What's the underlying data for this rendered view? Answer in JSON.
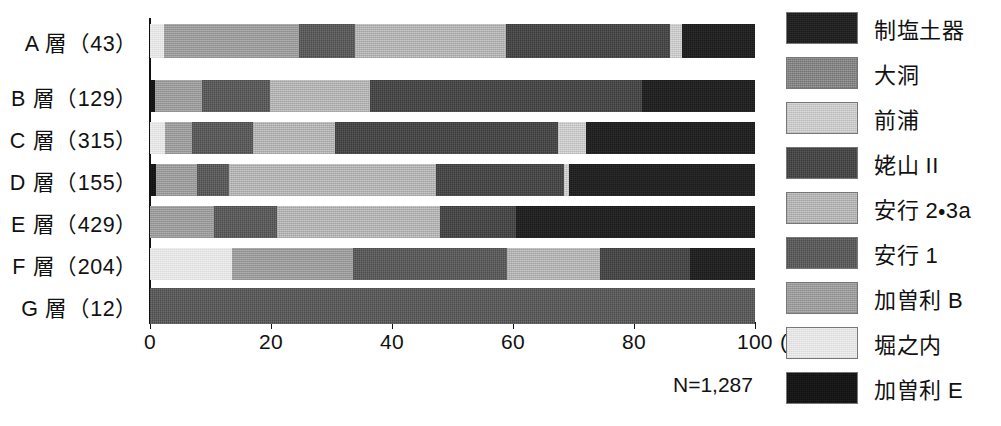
{
  "chart_data": {
    "type": "bar",
    "orientation": "horizontal",
    "stacked": true,
    "normalized_percent": true,
    "title": "",
    "xlabel": "(%)",
    "ylabel": "",
    "xlim": [
      0,
      100
    ],
    "xticks": [
      0,
      20,
      40,
      60,
      80,
      100
    ],
    "xticklabels": [
      "0",
      "20",
      "40",
      "60",
      "80",
      "100"
    ],
    "xunit_label": "(%)",
    "grid": false,
    "legend_position": "right",
    "annotation": "N=1,287",
    "categories": [
      "A 層（43）",
      "B 層（129）",
      "C 層（315）",
      "D 層（155）",
      "E 層（429）",
      "F 層（204）",
      "G 層（12）"
    ],
    "category_counts": [
      43,
      129,
      315,
      155,
      429,
      204,
      12
    ],
    "series": [
      {
        "name": "制塩土器",
        "key": "seien",
        "color": "#232323",
        "values": [
          12.0,
          18.6,
          28.0,
          31.5,
          39.5,
          10.7,
          0.0
        ]
      },
      {
        "name": "大洞",
        "key": "dairyu",
        "color": "#8a8a8a",
        "values": [
          0.0,
          0.0,
          0.0,
          0.0,
          0.0,
          0.0,
          0.0
        ]
      },
      {
        "name": "前浦",
        "key": "maeura",
        "color": "#dcdcdc",
        "values": [
          2.0,
          0.0,
          4.5,
          0.8,
          0.0,
          0.0,
          0.0
        ]
      },
      {
        "name": "姥山 II",
        "key": "ubayama",
        "color": "#4a4a4a",
        "values": [
          27.1,
          45.1,
          37.0,
          21.2,
          12.5,
          15.0,
          0.0
        ]
      },
      {
        "name": "安行 2・3a",
        "key": "angyo23",
        "color": "#c8c8c8",
        "values": [
          25.0,
          16.5,
          13.5,
          34.2,
          27.0,
          15.3,
          0.0
        ]
      },
      {
        "name": "安行 1",
        "key": "angyo1",
        "color": "#5e5e5e",
        "values": [
          9.3,
          11.2,
          10.0,
          5.2,
          10.5,
          25.5,
          100.0
        ]
      },
      {
        "name": "加曽利 B",
        "key": "kasoriB",
        "color": "#a6a6a6",
        "values": [
          22.3,
          7.8,
          4.5,
          6.8,
          10.5,
          20.0,
          0.0
        ]
      },
      {
        "name": "堀之内",
        "key": "horinouchi",
        "color": "#f0f0f0",
        "values": [
          2.3,
          0.0,
          2.5,
          0.3,
          0.0,
          13.5,
          0.0
        ]
      },
      {
        "name": "加曽利 E",
        "key": "kasoriE",
        "color": "#171717",
        "values": [
          0.0,
          0.8,
          0.0,
          1.0,
          0.0,
          0.0,
          0.0
        ]
      }
    ],
    "stack_order_left_to_right": [
      "kasoriE",
      "horinouchi",
      "kasoriB",
      "angyo1",
      "angyo23",
      "ubayama",
      "maeura",
      "dairyu",
      "seien"
    ],
    "rows": [
      {
        "label": "A 層（43）",
        "n": 43,
        "segments": [
          {
            "key": "horinouchi",
            "name": "堀之内",
            "value": 2.3
          },
          {
            "key": "kasoriB",
            "name": "加曽利 B",
            "value": 22.3
          },
          {
            "key": "angyo1",
            "name": "安行 1",
            "value": 9.3
          },
          {
            "key": "angyo23",
            "name": "安行 2・3a",
            "value": 25.0
          },
          {
            "key": "ubayama",
            "name": "姥山 II",
            "value": 27.1
          },
          {
            "key": "maeura",
            "name": "前浦",
            "value": 2.0
          },
          {
            "key": "seien",
            "name": "制塩土器",
            "value": 12.0
          }
        ]
      },
      {
        "label": "B 層（129）",
        "n": 129,
        "segments": [
          {
            "key": "kasoriE",
            "name": "加曽利 E",
            "value": 0.8
          },
          {
            "key": "kasoriB",
            "name": "加曽利 B",
            "value": 7.8
          },
          {
            "key": "angyo1",
            "name": "安行 1",
            "value": 11.2
          },
          {
            "key": "angyo23",
            "name": "安行 2・3a",
            "value": 16.5
          },
          {
            "key": "ubayama",
            "name": "姥山 II",
            "value": 45.1
          },
          {
            "key": "seien",
            "name": "制塩土器",
            "value": 18.6
          }
        ]
      },
      {
        "label": "C 層（315）",
        "n": 315,
        "segments": [
          {
            "key": "horinouchi",
            "name": "堀之内",
            "value": 2.5
          },
          {
            "key": "kasoriB",
            "name": "加曽利 B",
            "value": 4.5
          },
          {
            "key": "angyo1",
            "name": "安行 1",
            "value": 10.0
          },
          {
            "key": "angyo23",
            "name": "安行 2・3a",
            "value": 13.5
          },
          {
            "key": "ubayama",
            "name": "姥山 II",
            "value": 37.0
          },
          {
            "key": "maeura",
            "name": "前浦",
            "value": 4.5
          },
          {
            "key": "seien",
            "name": "制塩土器",
            "value": 28.0
          }
        ]
      },
      {
        "label": "D 層（155）",
        "n": 155,
        "segments": [
          {
            "key": "kasoriE",
            "name": "加曽利 E",
            "value": 1.0
          },
          {
            "key": "kasoriB",
            "name": "加曽利 B",
            "value": 6.8
          },
          {
            "key": "angyo1",
            "name": "安行 1",
            "value": 5.2
          },
          {
            "key": "angyo23",
            "name": "安行 2・3a",
            "value": 34.2
          },
          {
            "key": "ubayama",
            "name": "姥山 II",
            "value": 21.2
          },
          {
            "key": "maeura",
            "name": "前浦",
            "value": 0.8
          },
          {
            "key": "seien",
            "name": "制塩土器",
            "value": 30.8
          }
        ]
      },
      {
        "label": "E 層（429）",
        "n": 429,
        "segments": [
          {
            "key": "kasoriB",
            "name": "加曽利 B",
            "value": 10.5
          },
          {
            "key": "angyo1",
            "name": "安行 1",
            "value": 10.5
          },
          {
            "key": "angyo23",
            "name": "安行 2・3a",
            "value": 27.0
          },
          {
            "key": "ubayama",
            "name": "姥山 II",
            "value": 12.5
          },
          {
            "key": "seien",
            "name": "制塩土器",
            "value": 39.5
          }
        ]
      },
      {
        "label": "F 層（204）",
        "n": 204,
        "segments": [
          {
            "key": "horinouchi",
            "name": "堀之内",
            "value": 13.5
          },
          {
            "key": "kasoriB",
            "name": "加曽利 B",
            "value": 20.0
          },
          {
            "key": "angyo1",
            "name": "安行 1",
            "value": 25.5
          },
          {
            "key": "angyo23",
            "name": "安行 2・3a",
            "value": 15.3
          },
          {
            "key": "ubayama",
            "name": "姥山 II",
            "value": 15.0
          },
          {
            "key": "seien",
            "name": "制塩土器",
            "value": 10.7
          }
        ]
      },
      {
        "label": "G 層（12）",
        "n": 12,
        "segments": [
          {
            "key": "angyo1",
            "name": "安行 1",
            "value": 100.0
          }
        ]
      }
    ]
  },
  "axis": {
    "ticklabels": [
      "0",
      "20",
      "40",
      "60",
      "80",
      "100"
    ],
    "unit": "(%)"
  },
  "ylabels": [
    "A 層（43）",
    "B 層（129）",
    "C 層（315）",
    "D 層（155）",
    "E 層（429）",
    "F 層（204）",
    "G 層（12）"
  ],
  "annotation": {
    "n_total": "N=1,287"
  },
  "legend": {
    "items": [
      {
        "label": "制塩土器",
        "key": "seien",
        "color": "#232323"
      },
      {
        "label": "大洞",
        "key": "dairyu",
        "color": "#8a8a8a"
      },
      {
        "label": "前浦",
        "key": "maeura",
        "color": "#dcdcdc"
      },
      {
        "label": "姥山 II",
        "key": "ubayama",
        "color": "#4a4a4a"
      },
      {
        "label": "安行 2・3a",
        "key": "angyo23",
        "color": "#c8c8c8"
      },
      {
        "label": "安行 1",
        "key": "angyo1",
        "color": "#5e5e5e"
      },
      {
        "label": "加曽利 B",
        "key": "kasoriB",
        "color": "#a6a6a6"
      },
      {
        "label": "堀之内",
        "key": "horinouchi",
        "color": "#f0f0f0"
      },
      {
        "label": "加曽利 E",
        "key": "kasoriE",
        "color": "#171717"
      }
    ]
  }
}
